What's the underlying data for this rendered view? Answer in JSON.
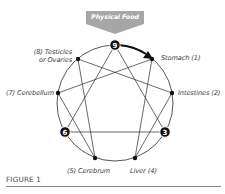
{
  "banner": {
    "label": "Physical Food",
    "color": "#a6a6a6"
  },
  "diagram": {
    "type": "enneagram",
    "center": [
      115,
      103
    ],
    "radius": 58,
    "nodes": [
      {
        "id": 9,
        "label": "",
        "badge": "9"
      },
      {
        "id": 1,
        "label": "Stomach (1)"
      },
      {
        "id": 2,
        "label": "Intestines (2)"
      },
      {
        "id": 3,
        "label": "",
        "badge": "3"
      },
      {
        "id": 4,
        "label": "Liver (4)"
      },
      {
        "id": 5,
        "label": "(5) Cerebrum"
      },
      {
        "id": 6,
        "label": "",
        "badge": "6"
      },
      {
        "id": 7,
        "label": "(7) Cerebellum"
      },
      {
        "id": 8,
        "label_line1": "(8) Testicles",
        "label_line2": "or Ovaries"
      }
    ],
    "triangle": [
      9,
      3,
      6
    ],
    "hexad": [
      1,
      4,
      2,
      8,
      5,
      7
    ],
    "arrow": {
      "from": 9,
      "to": 1
    }
  },
  "labels": {
    "stomach": "Stomach (1)",
    "intestines": "Intestines (2)",
    "liver": "Liver (4)",
    "cerebrum": "(5) Cerebrum",
    "cerebellum": "(7) Cerebellum",
    "testicles_line1": "(8) Testicles",
    "testicles_line2": "or Ovaries",
    "badge_9": "9",
    "badge_3": "3",
    "badge_6": "6"
  },
  "caption": "FIGURE 1"
}
